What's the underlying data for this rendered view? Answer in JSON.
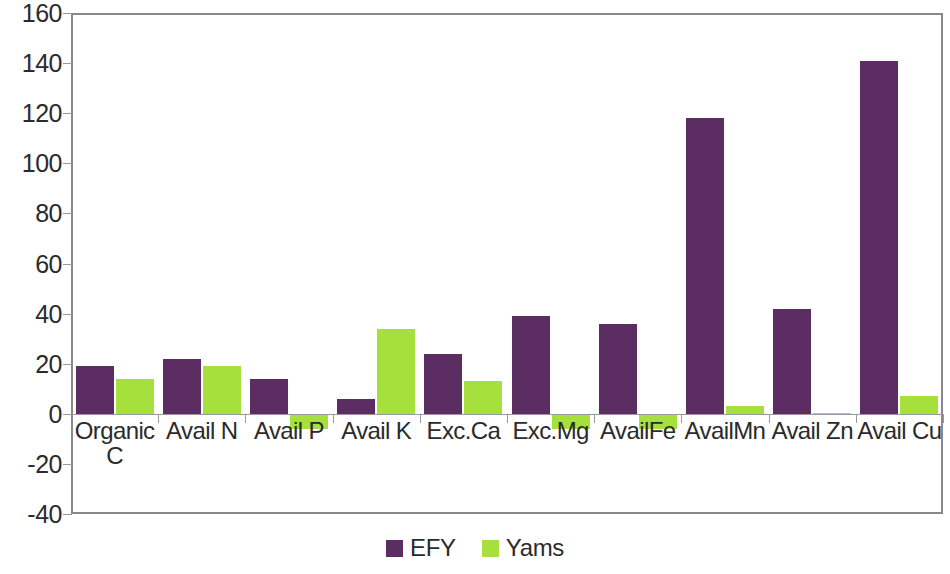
{
  "chart_data": {
    "type": "bar",
    "title": "",
    "xlabel": "",
    "ylabel": "",
    "ylim": [
      -40,
      160
    ],
    "y_ticks": [
      160,
      140,
      120,
      100,
      80,
      60,
      40,
      20,
      0,
      -20,
      -40
    ],
    "grid": false,
    "legend_position": "bottom",
    "categories": [
      "Organic\nC",
      "Avail N",
      "Avail P",
      "Avail K",
      "Exc.Ca",
      "Exc.Mg",
      "AvailFe",
      "AvailMn",
      "Avail Zn",
      "Avail Cu"
    ],
    "series": [
      {
        "name": "EFY",
        "color": "#5B2D63",
        "values": [
          19,
          22,
          14,
          6,
          24,
          39,
          36,
          118,
          42,
          141
        ]
      },
      {
        "name": "Yams",
        "color": "#A5E03C",
        "values": [
          14,
          19,
          -6,
          34,
          13,
          -6,
          -6,
          3,
          0.5,
          7
        ]
      }
    ]
  },
  "legend": {
    "items": [
      {
        "label": "EFY",
        "color": "#5B2D63",
        "swatch": "square-swatch"
      },
      {
        "label": "Yams",
        "color": "#A5E03C",
        "swatch": "square-swatch"
      }
    ]
  },
  "axis": {
    "y_tick_labels": [
      "160",
      "140",
      "120",
      "100",
      "80",
      "60",
      "40",
      "20",
      "0",
      "-20",
      "-40"
    ]
  }
}
